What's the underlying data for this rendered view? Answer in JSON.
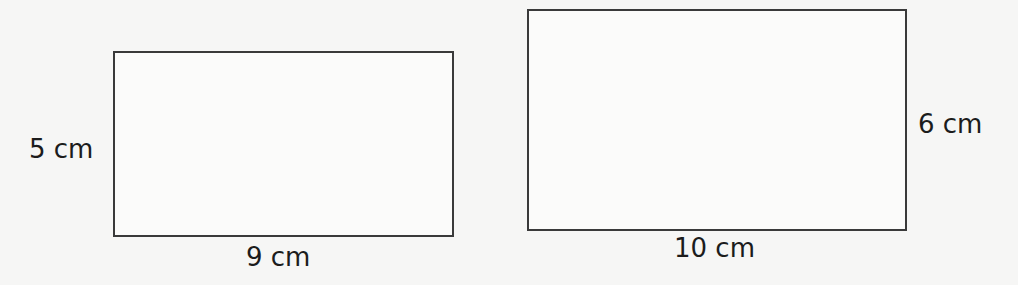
{
  "diagram": {
    "shapes": [
      {
        "name": "rectangle-a",
        "width_label": "9 cm",
        "height_label": "5 cm"
      },
      {
        "name": "rectangle-b",
        "width_label": "10 cm",
        "height_label": "6 cm"
      }
    ]
  }
}
